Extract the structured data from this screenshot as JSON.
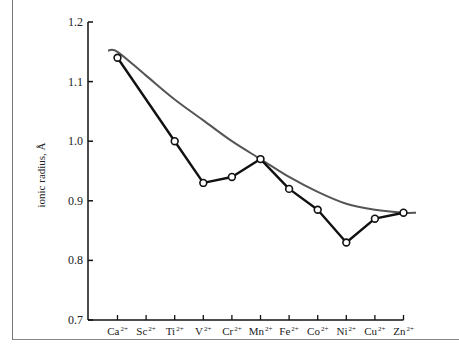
{
  "chart_data": {
    "type": "line",
    "title": "",
    "xlabel": "",
    "ylabel": "ionic radius, Å",
    "ylim": [
      0.7,
      1.2
    ],
    "yticks": [
      "0.7",
      "0.8",
      "0.9",
      "1.0",
      "1.1",
      "1.2"
    ],
    "grid": false,
    "categories": [
      "Ca2+",
      "Sc2+",
      "Ti2+",
      "V2+",
      "Cr2+",
      "Mn2+",
      "Fe2+",
      "Co2+",
      "Ni2+",
      "Cu2+",
      "Zn2+"
    ],
    "category_labels": [
      {
        "base": "Ca",
        "sup": "2+"
      },
      {
        "base": "Sc",
        "sup": "2+"
      },
      {
        "base": "Ti",
        "sup": "2+"
      },
      {
        "base": "V",
        "sup": "2+"
      },
      {
        "base": "Cr",
        "sup": "2+"
      },
      {
        "base": "Mn",
        "sup": "2+"
      },
      {
        "base": "Fe",
        "sup": "2+"
      },
      {
        "base": "Co",
        "sup": "2+"
      },
      {
        "base": "Ni",
        "sup": "2+"
      },
      {
        "base": "Cu",
        "sup": "2+"
      },
      {
        "base": "Zn",
        "sup": "2+"
      }
    ],
    "series": [
      {
        "name": "observed ionic radius",
        "style": "black line with open circle markers",
        "color": "#111111",
        "values": [
          1.14,
          null,
          1.0,
          0.93,
          0.94,
          0.97,
          0.92,
          0.885,
          0.83,
          0.87,
          0.88
        ]
      },
      {
        "name": "smooth trend (spherical ion)",
        "style": "gray smooth curve, no markers",
        "color": "#555555",
        "values": [
          1.15,
          1.11,
          1.07,
          1.035,
          1.0,
          0.97,
          0.94,
          0.915,
          0.895,
          0.885,
          0.88
        ]
      }
    ]
  }
}
